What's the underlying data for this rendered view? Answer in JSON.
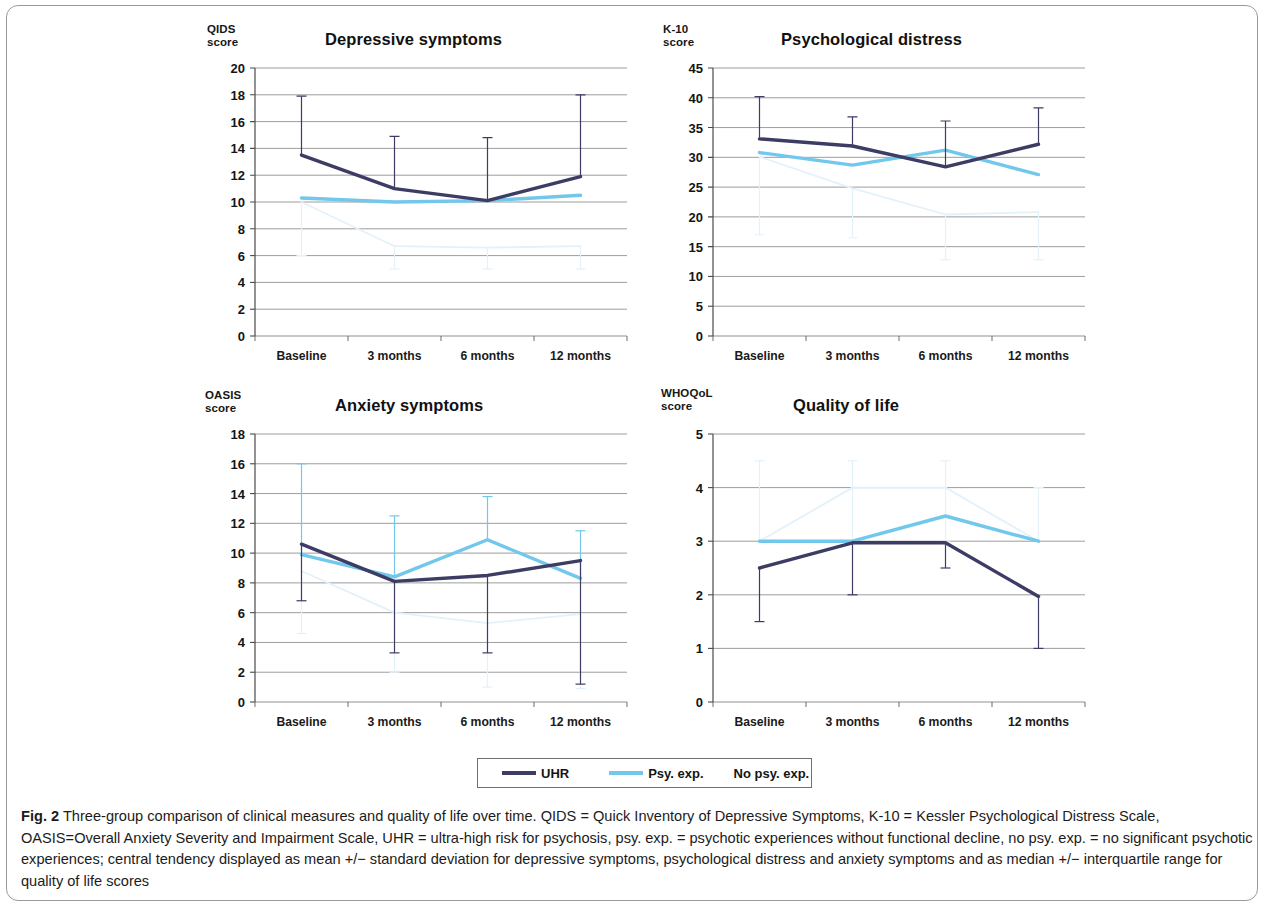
{
  "figure": {
    "label": "Fig. 2",
    "caption": "Three-group comparison of clinical measures and quality of life over time. QIDS = Quick Inventory of Depressive Symptoms, K-10 = Kessler Psychological Distress Scale, OASIS=Overall Anxiety Severity and Impairment Scale, UHR = ultra-high risk for psychosis, psy. exp. = psychotic experiences without functional decline, no psy. exp. = no significant psychotic experiences; central tendency displayed as mean +/− standard deviation for depressive symptoms, psychological distress and anxiety symptoms and as median +/− interquartile range for quality of life scores"
  },
  "legend": {
    "position": "bottom-center",
    "items": [
      {
        "label": "UHR",
        "color": "#3c3c64",
        "has_swatch": true
      },
      {
        "label": "Psy. exp.",
        "color": "#72c7ec",
        "has_swatch": true
      },
      {
        "label": "No psy. exp.",
        "color": "#eaf5fc",
        "has_swatch": false
      }
    ]
  },
  "colors": {
    "uhr": "#3c3c64",
    "psy_exp": "#72c7ec",
    "no_psy_exp": "#e3f1fa",
    "gridline": "#6e6e6e",
    "axis": "#4a4a4a"
  },
  "chart_data": [
    {
      "id": "depressive-symptoms",
      "type": "line",
      "title": "Depressive symptoms",
      "ylabel": "QIDS\nscore",
      "xlabel": "",
      "categories": [
        "Baseline",
        "3 months",
        "6 months",
        "12 months"
      ],
      "ylim": [
        0,
        20
      ],
      "yticks": [
        0,
        2,
        4,
        6,
        8,
        10,
        12,
        14,
        16,
        18,
        20
      ],
      "grid": true,
      "series": [
        {
          "name": "UHR",
          "values": [
            13.5,
            11.0,
            10.1,
            11.9
          ],
          "err_low": [
            13.5,
            11.0,
            10.1,
            11.9
          ],
          "err_high": [
            17.9,
            14.9,
            14.8,
            18.0
          ]
        },
        {
          "name": "Psy. exp.",
          "values": [
            10.3,
            10.0,
            10.1,
            10.5
          ],
          "err_low": [
            10.3,
            10.0,
            10.1,
            10.5
          ],
          "err_high": [
            10.3,
            10.0,
            10.1,
            10.5
          ]
        },
        {
          "name": "No psy. exp.",
          "values": [
            10.0,
            6.7,
            6.6,
            6.7
          ],
          "err_low": [
            6.0,
            5.0,
            5.0,
            5.0
          ],
          "err_high": [
            10.0,
            6.7,
            6.6,
            6.7
          ]
        }
      ]
    },
    {
      "id": "psychological-distress",
      "type": "line",
      "title": "Psychological distress",
      "ylabel": "K-10\nscore",
      "xlabel": "",
      "categories": [
        "Baseline",
        "3 months",
        "6 months",
        "12 months"
      ],
      "ylim": [
        0,
        45
      ],
      "yticks": [
        0,
        5,
        10,
        15,
        20,
        25,
        30,
        35,
        40,
        45
      ],
      "grid": true,
      "series": [
        {
          "name": "UHR",
          "values": [
            33.1,
            31.9,
            28.4,
            32.2
          ],
          "err_low": [
            33.1,
            31.9,
            28.4,
            32.2
          ],
          "err_high": [
            40.2,
            36.8,
            36.1,
            38.3
          ]
        },
        {
          "name": "Psy. exp.",
          "values": [
            30.8,
            28.7,
            31.2,
            27.1
          ],
          "err_low": [
            30.8,
            28.7,
            31.2,
            27.1
          ],
          "err_high": [
            30.8,
            28.7,
            31.2,
            27.1
          ]
        },
        {
          "name": "No psy. exp.",
          "values": [
            30.1,
            24.8,
            20.4,
            20.8
          ],
          "err_low": [
            17.0,
            16.5,
            12.8,
            12.8
          ],
          "err_high": [
            30.1,
            24.8,
            20.4,
            20.8
          ]
        }
      ]
    },
    {
      "id": "anxiety-symptoms",
      "type": "line",
      "title": "Anxiety symptoms",
      "ylabel": "OASIS\nscore",
      "xlabel": "",
      "categories": [
        "Baseline",
        "3 months",
        "6 months",
        "12 months"
      ],
      "ylim": [
        0,
        18
      ],
      "yticks": [
        0,
        2,
        4,
        6,
        8,
        10,
        12,
        14,
        16,
        18
      ],
      "grid": true,
      "series": [
        {
          "name": "UHR",
          "values": [
            10.6,
            8.1,
            8.5,
            9.5
          ],
          "err_low": [
            6.8,
            3.3,
            3.3,
            1.2
          ],
          "err_high": [
            10.6,
            8.1,
            8.5,
            9.5
          ]
        },
        {
          "name": "Psy. exp.",
          "values": [
            9.9,
            8.4,
            10.9,
            8.3
          ],
          "err_low": [
            9.9,
            8.4,
            10.9,
            8.3
          ],
          "err_high": [
            16.0,
            12.5,
            13.8,
            11.5
          ]
        },
        {
          "name": "No psy. exp.",
          "values": [
            8.8,
            6.0,
            5.3,
            5.9
          ],
          "err_low": [
            4.6,
            2.0,
            1.0,
            0.9
          ],
          "err_high": [
            8.8,
            6.0,
            5.3,
            5.9
          ]
        }
      ]
    },
    {
      "id": "quality-of-life",
      "type": "line",
      "title": "Quality of life",
      "ylabel": "WHOQoL\nscore",
      "xlabel": "",
      "categories": [
        "Baseline",
        "3 months",
        "6 months",
        "12 months"
      ],
      "ylim": [
        0,
        5
      ],
      "yticks": [
        0,
        1,
        2,
        3,
        4,
        5
      ],
      "grid": true,
      "series": [
        {
          "name": "UHR",
          "values": [
            2.5,
            2.97,
            2.97,
            1.97
          ],
          "err_low": [
            1.5,
            2.0,
            2.5,
            1.0
          ],
          "err_high": [
            2.5,
            2.97,
            2.97,
            1.97
          ]
        },
        {
          "name": "Psy. exp.",
          "values": [
            3.0,
            3.0,
            3.47,
            3.0
          ],
          "err_low": [
            3.0,
            3.0,
            3.47,
            3.0
          ],
          "err_high": [
            3.0,
            3.0,
            3.47,
            3.0
          ]
        },
        {
          "name": "No psy. exp.",
          "values": [
            3.0,
            4.0,
            4.0,
            3.0
          ],
          "err_low": [
            3.0,
            3.0,
            3.0,
            3.0
          ],
          "err_high": [
            4.5,
            4.5,
            4.5,
            4.0
          ]
        }
      ]
    }
  ]
}
